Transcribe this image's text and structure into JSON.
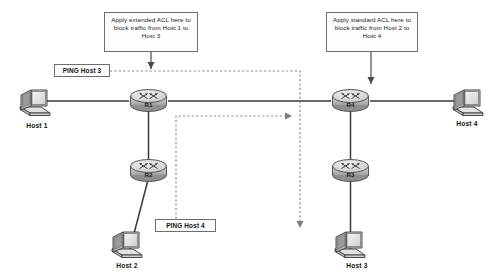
{
  "diagram": {
    "type": "network-diagram",
    "colors": {
      "line": "#3a3a3a",
      "dashed": "#8c8c8c",
      "device_fill": "#d9d9d9",
      "device_stroke": "#3a3a3a",
      "box_stroke": "#6e6e6e",
      "box_fill": "#fdfdfd",
      "text": "#111111"
    },
    "callouts": [
      {
        "id": "acl-extended",
        "text": "Apply extended ACL here to block traffic from Host 1 to Host 3",
        "points_to": "R1"
      },
      {
        "id": "acl-standard",
        "text": "Apply standard ACL here to block traffic from Host 2 to Host 4",
        "points_to": "R4"
      }
    ],
    "ping_labels": [
      {
        "id": "ping-host-3",
        "text": "PING Host 3",
        "source": "Host 1",
        "target": "Host 3"
      },
      {
        "id": "ping-host-4",
        "text": "PING Host 4",
        "source": "Host 2",
        "target": "Host 4"
      }
    ],
    "routers": [
      {
        "id": "r1",
        "label": "R1"
      },
      {
        "id": "r2",
        "label": "R2"
      },
      {
        "id": "r3",
        "label": "R3"
      },
      {
        "id": "r4",
        "label": "R4"
      }
    ],
    "hosts": [
      {
        "id": "host1",
        "label": "Host 1"
      },
      {
        "id": "host2",
        "label": "Host 2"
      },
      {
        "id": "host3",
        "label": "Host 3"
      },
      {
        "id": "host4",
        "label": "Host 4"
      }
    ],
    "links": [
      {
        "from": "Host 1",
        "to": "R1",
        "style": "solid"
      },
      {
        "from": "R1",
        "to": "R4",
        "style": "solid"
      },
      {
        "from": "R4",
        "to": "Host 4",
        "style": "solid"
      },
      {
        "from": "R1",
        "to": "R2",
        "style": "solid"
      },
      {
        "from": "R2",
        "to": "Host 2",
        "style": "solid"
      },
      {
        "from": "R4",
        "to": "R3",
        "style": "solid"
      },
      {
        "from": "R3",
        "to": "Host 3",
        "style": "solid"
      }
    ],
    "traffic_flows": [
      {
        "id": "flow-ping-host-3",
        "label": "PING Host 3",
        "style": "dashed",
        "direction": "Host 1 to Host 3"
      },
      {
        "id": "flow-ping-host-4",
        "label": "PING Host 4",
        "style": "dashed",
        "direction": "Host 2 to Host 4"
      }
    ]
  }
}
